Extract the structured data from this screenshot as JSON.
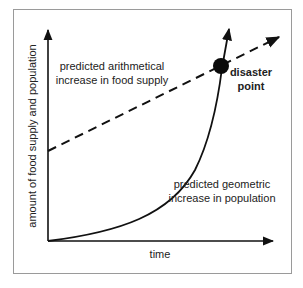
{
  "axes": {
    "x_label": "time",
    "y_label": "amount of food supply and population"
  },
  "annotations": {
    "food_line1": "predicted arithmetical",
    "food_line2": "increase in food supply",
    "pop_line1": "predicted geometric",
    "pop_line2": "increase in population",
    "disaster_line1": "disaster",
    "disaster_line2": "point"
  },
  "series": [
    {
      "name": "food supply",
      "style": "dashed",
      "shape": "linear"
    },
    {
      "name": "population",
      "style": "solid",
      "shape": "exponential"
    }
  ],
  "colors": {
    "frame": "#9a9a9a",
    "ink": "#111111",
    "text": "#222222"
  }
}
